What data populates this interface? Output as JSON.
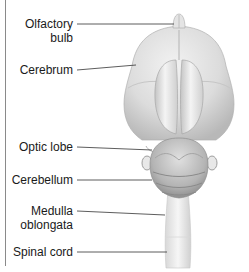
{
  "diagram": {
    "labels": [
      {
        "id": "olfactory-bulb",
        "line1": "Olfactory",
        "line2": "bulb"
      },
      {
        "id": "cerebrum",
        "line1": "Cerebrum"
      },
      {
        "id": "optic-lobe",
        "line1": "Optic lobe"
      },
      {
        "id": "cerebellum",
        "line1": "Cerebellum"
      },
      {
        "id": "medulla-oblongata",
        "line1": "Medulla",
        "line2": "oblongata"
      },
      {
        "id": "spinal-cord",
        "line1": "Spinal cord"
      }
    ],
    "colors": {
      "text": "#1a1a1a",
      "leader": "#333333",
      "tissue_light": "#e6e6e6",
      "tissue_mid": "#c8c8c8",
      "tissue_dark": "#9a9a9a",
      "frame": "#8a8a8a"
    }
  }
}
